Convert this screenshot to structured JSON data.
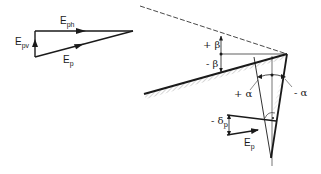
{
  "diagram": {
    "type": "earth-pressure-geometry",
    "force_triangle": {
      "horizontal_component": {
        "symbol": "E",
        "subscript": "ph"
      },
      "vertical_component": {
        "symbol": "E",
        "subscript": "pv"
      },
      "resultant": {
        "symbol": "E",
        "subscript": "p"
      }
    },
    "wall_geometry": {
      "slope_angle_positive": {
        "sign": "+",
        "symbol": "β"
      },
      "slope_angle_negative": {
        "sign": "-",
        "symbol": "β"
      },
      "wall_angle_positive": {
        "sign": "+",
        "symbol": "α"
      },
      "wall_angle_negative": {
        "sign": "-",
        "symbol": "α"
      },
      "friction_angle": {
        "sign": "-",
        "symbol": "δ",
        "subscript": "p"
      },
      "force": {
        "symbol": "E",
        "subscript": "p"
      }
    },
    "colors": {
      "line": "#1a1a1a",
      "hatch": "#888888",
      "background": "#ffffff"
    }
  }
}
